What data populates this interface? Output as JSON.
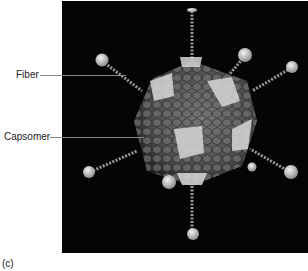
{
  "figure": {
    "panel_label": "(c)",
    "background_color": "#050505",
    "labels": [
      {
        "text": "Fiber",
        "points_to": "fiber"
      },
      {
        "text": "Capsomer",
        "points_to": "capsomer"
      }
    ]
  }
}
